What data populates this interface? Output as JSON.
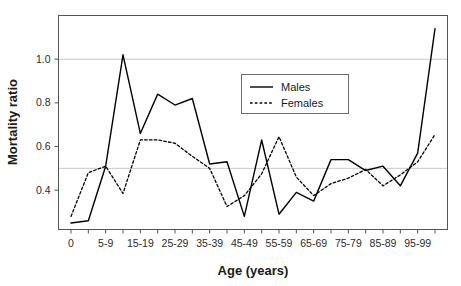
{
  "chart_data": {
    "type": "line",
    "title": "",
    "xlabel": "Age (years)",
    "ylabel": "Mortality ratio",
    "categories": [
      "0",
      "1-4",
      "5-9",
      "10-14",
      "15-19",
      "20-24",
      "25-29",
      "30-34",
      "35-39",
      "40-44",
      "45-49",
      "50-54",
      "55-59",
      "60-64",
      "65-69",
      "70-74",
      "75-79",
      "80-84",
      "85-89",
      "90-94",
      "95-99",
      "100+"
    ],
    "xtick_labels": [
      "0",
      "",
      "5-9",
      "",
      "15-19",
      "",
      "25-29",
      "",
      "35-39",
      "",
      "45-49",
      "",
      "55-59",
      "",
      "65-69",
      "",
      "75-79",
      "",
      "85-89",
      "",
      "95-99",
      ""
    ],
    "ytick_labels": [
      "0.4",
      "0.6",
      "0.8",
      "1.0"
    ],
    "ytick_values": [
      0.4,
      0.6,
      0.8,
      1.0
    ],
    "ylim": [
      0.22,
      1.2
    ],
    "xlim": [
      -0.6,
      21.6
    ],
    "gridlines": [
      0.5,
      1.0
    ],
    "grid": true,
    "legend_position": "top-right-inside",
    "series": [
      {
        "name": "Males",
        "style": "solid",
        "color": "#000000",
        "values": [
          0.25,
          0.26,
          0.51,
          1.02,
          0.66,
          0.84,
          0.79,
          0.82,
          0.52,
          0.53,
          0.28,
          0.63,
          0.29,
          0.39,
          0.35,
          0.54,
          0.54,
          0.49,
          0.51,
          0.42,
          0.57,
          1.14
        ]
      },
      {
        "name": "Females",
        "style": "dashed",
        "color": "#000000",
        "values": [
          0.28,
          0.48,
          0.51,
          0.385,
          0.63,
          0.63,
          0.615,
          0.555,
          0.5,
          0.325,
          0.375,
          0.475,
          0.645,
          0.46,
          0.375,
          0.43,
          0.455,
          0.495,
          0.42,
          0.47,
          0.53,
          0.655
        ]
      }
    ]
  },
  "legend": {
    "entries": [
      {
        "label": "Males",
        "style": "solid"
      },
      {
        "label": "Females",
        "style": "dashed"
      }
    ]
  }
}
